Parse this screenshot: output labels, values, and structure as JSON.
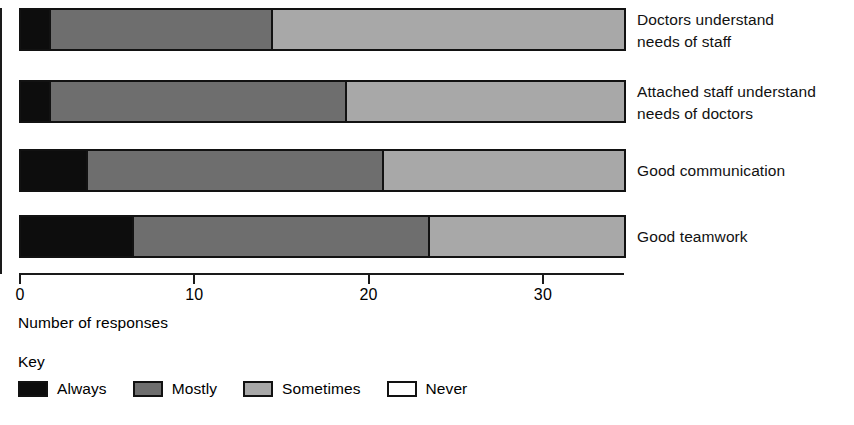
{
  "chart_data": {
    "type": "bar",
    "orientation": "horizontal",
    "stacked": true,
    "title": "",
    "xlabel": "Number of responses",
    "ylabel": "",
    "xlim": [
      0,
      34.6
    ],
    "xticks": [
      0,
      10,
      20,
      30
    ],
    "xtick_labels": [
      "0",
      "10",
      "20",
      "30"
    ],
    "grid": false,
    "legend_position": "bottom-left",
    "legend_title": "Key",
    "categories": [
      "Doctors understand\nneeds of staff",
      "Attached staff understand\nneeds of doctors",
      "Good communication",
      "Good teamwork"
    ],
    "series": [
      {
        "name": "Always",
        "color": "#0d0d0d",
        "values": [
          1.5,
          1.5,
          3.5,
          6
        ]
      },
      {
        "name": "Mostly",
        "color": "#6e6e6e",
        "values": [
          12,
          16,
          16,
          16
        ]
      },
      {
        "name": "Sometimes",
        "color": "#a8a8a8",
        "values": [
          19.1,
          15.1,
          13.1,
          10.6
        ]
      },
      {
        "name": "Never",
        "color": "#ffffff",
        "values": [
          0,
          0,
          0,
          0
        ]
      }
    ],
    "totals": [
      32.6,
      32.6,
      32.6,
      32.6
    ],
    "bar_pixel_geometry": {
      "plot_left_px": 19,
      "px_per_unit": 18.5,
      "bar_height_px": 43,
      "bar_tops_px": [
        8,
        80,
        149,
        215
      ]
    }
  },
  "axis": {
    "x_title": "Number of responses",
    "ticks": [
      {
        "label": "0",
        "value": 0
      },
      {
        "label": "10",
        "value": 10
      },
      {
        "label": "20",
        "value": 20
      },
      {
        "label": "30",
        "value": 30
      }
    ]
  },
  "legend": {
    "title": "Key",
    "items": [
      {
        "label": "Always",
        "color": "#0d0d0d"
      },
      {
        "label": "Mostly",
        "color": "#6e6e6e"
      },
      {
        "label": "Sometimes",
        "color": "#a8a8a8"
      },
      {
        "label": "Never",
        "color": "#ffffff"
      }
    ]
  }
}
